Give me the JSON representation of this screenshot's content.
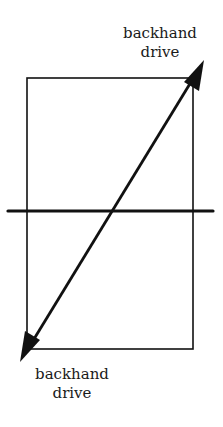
{
  "diagram": {
    "type": "tennis-court-shot-direction",
    "labels": {
      "top": {
        "line1": "backhand",
        "line2": "drive"
      },
      "bottom": {
        "line1": "backhand",
        "line2": "drive"
      }
    },
    "colors": {
      "stroke": "#111111",
      "background": "#ffffff",
      "text": "#1a1a1a"
    },
    "elements": {
      "court": {
        "x": 27,
        "y": 78,
        "width": 166,
        "height": 271
      },
      "net": {
        "x1": 8,
        "y1": 211,
        "x2": 213,
        "y2": 211
      },
      "arrow": {
        "x1": 20,
        "y1": 362,
        "x2": 204,
        "y2": 60,
        "double_headed": true
      }
    }
  }
}
